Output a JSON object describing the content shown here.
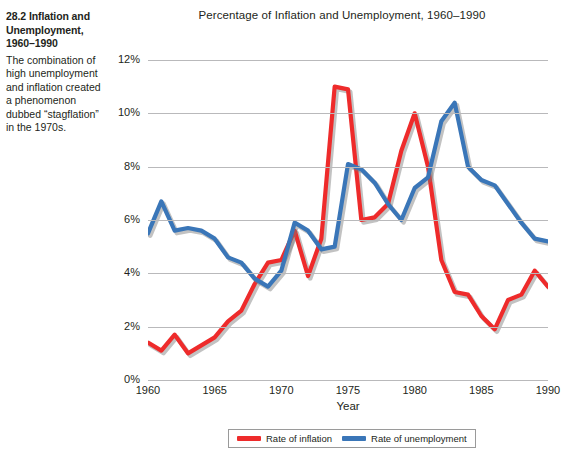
{
  "figure": {
    "number": "28.2",
    "heading": "Inflation and Unemployment, 1960–1990",
    "heading_rest": "Inflation and",
    "heading_line2": "Unemployment,",
    "heading_line3": "1960–1990",
    "body": "The combination of high unemployment and inflation created a phenomenon dubbed “stagflation” in the 1970s."
  },
  "chart_data": {
    "type": "line",
    "title": "Percentage of Inflation and Unemployment, 1960–1990",
    "xlabel": "Year",
    "ylabel": "",
    "xlim": [
      1960,
      1990
    ],
    "ylim": [
      0,
      12
    ],
    "xticks": [
      1960,
      1965,
      1970,
      1975,
      1980,
      1985,
      1990
    ],
    "xtick_labels": [
      "1960",
      "1965",
      "1970",
      "1975",
      "1980",
      "1985",
      "1990"
    ],
    "yticks": [
      0,
      2,
      4,
      6,
      8,
      10,
      12
    ],
    "ytick_labels": [
      "0%",
      "2%",
      "4%",
      "6%",
      "8%",
      "10%",
      "12%"
    ],
    "grid": "horizontal",
    "legend_position": "bottom",
    "x": [
      1960,
      1961,
      1962,
      1963,
      1964,
      1965,
      1966,
      1967,
      1968,
      1969,
      1970,
      1971,
      1972,
      1973,
      1974,
      1975,
      1976,
      1977,
      1978,
      1979,
      1980,
      1981,
      1982,
      1983,
      1984,
      1985,
      1986,
      1987,
      1988,
      1989,
      1990
    ],
    "series": [
      {
        "name": "Rate of inflation",
        "color": "#ee2b2b",
        "values": [
          1.4,
          1.1,
          1.7,
          1.0,
          1.3,
          1.6,
          2.2,
          2.6,
          3.6,
          4.4,
          4.5,
          5.6,
          3.9,
          5.3,
          11.0,
          10.9,
          6.0,
          6.1,
          6.6,
          8.6,
          10.0,
          8.0,
          4.5,
          3.3,
          3.2,
          2.4,
          1.9,
          3.0,
          3.2,
          4.1,
          3.5
        ]
      },
      {
        "name": "Rate of unemployment",
        "color": "#3a76b8",
        "values": [
          5.5,
          6.7,
          5.6,
          5.7,
          5.6,
          5.3,
          4.6,
          4.4,
          3.8,
          3.5,
          4.1,
          5.9,
          5.6,
          4.9,
          5.0,
          8.1,
          7.9,
          7.4,
          6.6,
          6.0,
          7.2,
          7.6,
          9.7,
          10.4,
          8.0,
          7.5,
          7.3,
          6.6,
          5.9,
          5.3,
          5.2
        ]
      }
    ]
  },
  "legend": {
    "items": [
      {
        "label": "Rate of inflation",
        "color": "#ee2b2b"
      },
      {
        "label": "Rate of unemployment",
        "color": "#3a76b8"
      }
    ]
  }
}
